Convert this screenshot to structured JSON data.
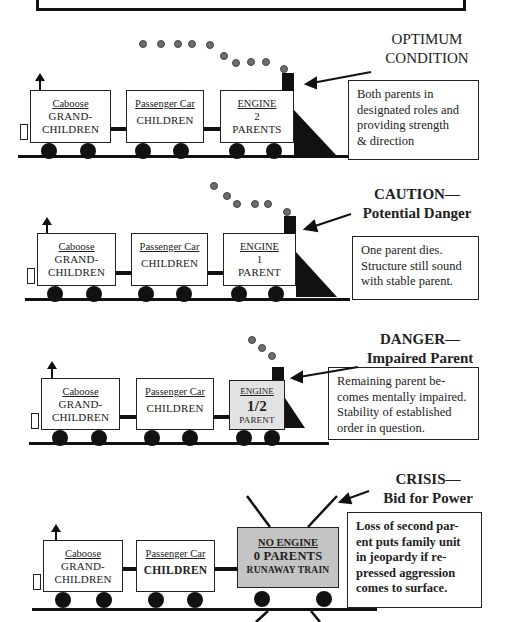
{
  "trains": [
    {
      "status_label": [
        "OPTIMUM",
        "CONDITION"
      ],
      "status_bold": false,
      "caboose": {
        "name": "Caboose",
        "lines": [
          "GRAND-",
          "CHILDREN"
        ]
      },
      "passenger": {
        "name": "Passenger Car",
        "lines": [
          "CHILDREN"
        ]
      },
      "engine": {
        "name": "ENGINE",
        "lines": [
          "2",
          "PARENTS"
        ]
      },
      "description": [
        "Both parents in",
        "designated roles and",
        "providing strength",
        "& direction"
      ]
    },
    {
      "status_label": [
        "CAUTION—",
        "Potential Danger"
      ],
      "status_bold": true,
      "caboose": {
        "name": "Caboose",
        "lines": [
          "GRAND-",
          "CHILDREN"
        ]
      },
      "passenger": {
        "name": "Passenger Car",
        "lines": [
          "CHILDREN"
        ]
      },
      "engine": {
        "name": "ENGINE",
        "lines": [
          "1",
          "PARENT"
        ]
      },
      "description": [
        "One parent dies.",
        "Structure still sound",
        "with stable parent."
      ]
    },
    {
      "status_label": [
        "DANGER—",
        "Impaired Parent"
      ],
      "status_bold": true,
      "caboose": {
        "name": "Caboose",
        "lines": [
          "GRAND-",
          "CHILDREN"
        ]
      },
      "passenger": {
        "name": "Passenger Car",
        "lines": [
          "CHILDREN"
        ]
      },
      "engine": {
        "name": "ENGINE",
        "lines": [
          "1/2",
          "PARENT"
        ]
      },
      "description": [
        "Remaining parent be-",
        "comes mentally impaired.",
        "Stability of established",
        "order in question."
      ]
    },
    {
      "status_label": [
        "CRISIS—",
        "Bid for Power"
      ],
      "status_bold": true,
      "caboose": {
        "name": "Caboose",
        "lines": [
          "GRAND-",
          "CHILDREN"
        ]
      },
      "passenger": {
        "name": "Passenger Car",
        "lines": [
          "CHILDREN"
        ]
      },
      "engine": {
        "name": "NO ENGINE",
        "lines": [
          "0 PARENTS",
          "RUNAWAY TRAIN"
        ]
      },
      "description": [
        "Loss of second par-",
        "ent puts family unit",
        "in jeopardy if re-",
        "pressed aggression",
        "comes to surface."
      ]
    }
  ],
  "colors": {
    "ink": "#111111",
    "smoke": "#6d6d6d",
    "impaired_engine_fill": "#d8d8d8",
    "no_engine_fill": "#c4c4c4"
  }
}
